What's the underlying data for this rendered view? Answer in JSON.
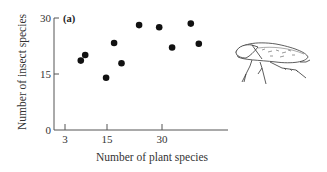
{
  "chart_data": {
    "type": "scatter",
    "title": "",
    "panel_label": "(a)",
    "xlabel": "Number of plant species",
    "ylabel": "Number of insect species",
    "xlim": [
      0,
      47
    ],
    "ylim": [
      0,
      30
    ],
    "x_ticks": [
      3,
      15,
      30
    ],
    "y_ticks": [
      0,
      15,
      30
    ],
    "grid": false,
    "legend": null,
    "series": [
      {
        "name": "insect vs plant species",
        "marker": "filled-circle",
        "color": "#111111",
        "points": [
          {
            "x": 7.3,
            "y": 18.6
          },
          {
            "x": 8.5,
            "y": 20.1
          },
          {
            "x": 14.2,
            "y": 14.0
          },
          {
            "x": 16.4,
            "y": 23.3
          },
          {
            "x": 18.4,
            "y": 17.9
          },
          {
            "x": 23.2,
            "y": 28.1
          },
          {
            "x": 28.7,
            "y": 27.5
          },
          {
            "x": 32.2,
            "y": 22.1
          },
          {
            "x": 37.3,
            "y": 28.5
          },
          {
            "x": 39.5,
            "y": 23.1
          }
        ]
      }
    ],
    "annotations": [
      "leafhopper insect illustration (right of plot)"
    ]
  },
  "labels": {
    "panel": "(a)",
    "x_axis": "Number of plant species",
    "y_axis": "Number of insect species",
    "x_tick_3": "3",
    "x_tick_15": "15",
    "x_tick_30": "30",
    "y_tick_0": "0",
    "y_tick_15": "15",
    "y_tick_30": "30"
  }
}
